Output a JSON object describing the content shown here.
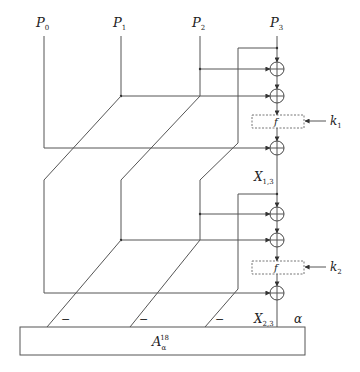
{
  "inputs": [
    {
      "base": "P",
      "sub": "0",
      "x": 44
    },
    {
      "base": "P",
      "sub": "1",
      "x": 121
    },
    {
      "base": "P",
      "sub": "2",
      "x": 200
    },
    {
      "base": "P",
      "sub": "3",
      "x": 277
    }
  ],
  "rounds": [
    {
      "f_label": "f",
      "key": {
        "base": "k",
        "sub": "1"
      },
      "output": {
        "base": "X",
        "sub": "1,3"
      }
    },
    {
      "f_label": "f",
      "key": {
        "base": "k",
        "sub": "2"
      },
      "output": {
        "base": "X",
        "sub": "2,3"
      }
    }
  ],
  "minus_signs": [
    "−",
    "−",
    "−"
  ],
  "alpha_label": "α",
  "accumulator": {
    "base": "A",
    "sub": "α",
    "sup": "18"
  },
  "colors": {
    "line": "#555555",
    "text": "#222222"
  }
}
